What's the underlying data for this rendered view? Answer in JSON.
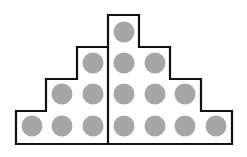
{
  "diagram": {
    "colors": {
      "outline": "#111111",
      "dot": "#a6a6a6",
      "background": "#ffffff"
    },
    "columns": [
      {
        "index": 1,
        "dots": 1,
        "side": "left"
      },
      {
        "index": 2,
        "dots": 2,
        "side": "left"
      },
      {
        "index": 3,
        "dots": 3,
        "side": "left"
      },
      {
        "index": 4,
        "dots": 4,
        "side": "right"
      },
      {
        "index": 5,
        "dots": 3,
        "side": "right"
      },
      {
        "index": 6,
        "dots": 2,
        "side": "right"
      },
      {
        "index": 7,
        "dots": 1,
        "side": "right"
      }
    ],
    "left_total": 6,
    "right_total": 10,
    "total_dots": 16
  }
}
